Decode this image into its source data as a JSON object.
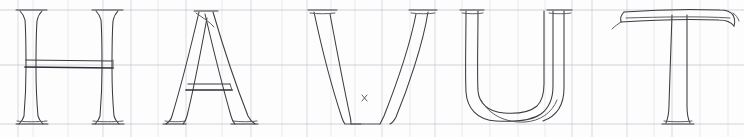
{
  "sheet": {
    "title": "HAVUT",
    "description": "Hand-drawn outlined Roman capital letters on a ruled practice grid",
    "word": "HAVUT",
    "background_color": "#fdfdfd",
    "ink_color": "#3b3b40",
    "guide_color": "#b9bfc9",
    "guide_color_faint": "#dde1e8",
    "width": 744,
    "height": 137
  },
  "guides": {
    "cap_height_label": "cap-height line",
    "waist_label": "waist line",
    "baseline_label": "baseline",
    "cap_height_y": 10,
    "waist_y": 65,
    "baseline_y": 124,
    "vertical_x": [
      18,
      33,
      68,
      90,
      103,
      131,
      158,
      186,
      222,
      251,
      282,
      307,
      331,
      355,
      382,
      410,
      435,
      462,
      490,
      518,
      545,
      572,
      592,
      627,
      654,
      672,
      700,
      728
    ]
  },
  "letters": [
    {
      "name": "letter-h",
      "char": "H",
      "order": 1,
      "x_left": 18,
      "x_right": 131,
      "note": "outlined serif H with doubled crossbar"
    },
    {
      "name": "letter-a",
      "char": "A",
      "order": 2,
      "x_left": 158,
      "x_right": 286,
      "note": "outlined serif A with doubled crossbar and crossed apex"
    },
    {
      "name": "letter-v",
      "char": "V",
      "order": 3,
      "x_left": 305,
      "x_right": 437,
      "note": "outlined serif V with pointed vertex"
    },
    {
      "name": "letter-u",
      "char": "U",
      "order": 4,
      "x_left": 462,
      "x_right": 578,
      "note": "outlined serif U with rounded bowl"
    },
    {
      "name": "letter-t",
      "char": "T",
      "order": 5,
      "x_left": 618,
      "x_right": 740,
      "note": "outlined serif T with flared arm"
    }
  ]
}
